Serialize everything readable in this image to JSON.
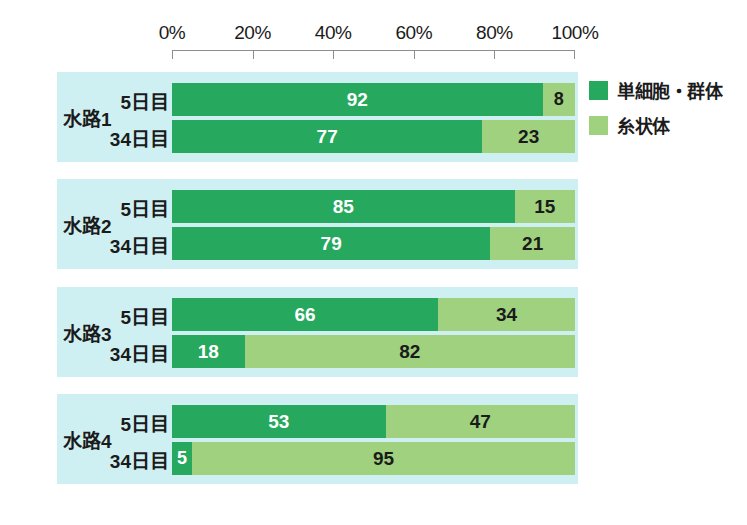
{
  "chart_data": {
    "type": "bar",
    "orientation": "horizontal",
    "stacked": true,
    "normalized": true,
    "title": "",
    "subtitle": "",
    "xlabel": "",
    "ylabel": "",
    "xlim": [
      0,
      100
    ],
    "grid": false,
    "legend_position": "right",
    "axis_ticks": [
      "0%",
      "20%",
      "40%",
      "60%",
      "80%",
      "100%"
    ],
    "axis_tick_values": [
      0,
      20,
      40,
      60,
      80,
      100
    ],
    "legend": [
      {
        "name": "単細胞・群体",
        "color": "#26a95e"
      },
      {
        "name": "糸状体",
        "color": "#9fd17e"
      }
    ],
    "series": [
      {
        "name": "単細胞・群体",
        "color": "#26a95e",
        "values": [
          92,
          77,
          85,
          79,
          66,
          18,
          53,
          5
        ]
      },
      {
        "name": "糸状体",
        "color": "#9fd17e",
        "values": [
          8,
          23,
          15,
          21,
          34,
          82,
          47,
          95
        ]
      }
    ],
    "categories": [
      "水路1 5日目",
      "水路1 34日目",
      "水路2 5日目",
      "水路2 34日目",
      "水路3 5日目",
      "水路3 34日目",
      "水路4 5日目",
      "水路4 34日目"
    ],
    "groups": [
      {
        "label": "水路1",
        "rows": [
          {
            "label": "5日目",
            "segments": [
              {
                "series": "単細胞・群体",
                "value": 92
              },
              {
                "series": "糸状体",
                "value": 8
              }
            ]
          },
          {
            "label": "34日目",
            "segments": [
              {
                "series": "単細胞・群体",
                "value": 77
              },
              {
                "series": "糸状体",
                "value": 23
              }
            ]
          }
        ]
      },
      {
        "label": "水路2",
        "rows": [
          {
            "label": "5日目",
            "segments": [
              {
                "series": "単細胞・群体",
                "value": 85
              },
              {
                "series": "糸状体",
                "value": 15
              }
            ]
          },
          {
            "label": "34日目",
            "segments": [
              {
                "series": "単細胞・群体",
                "value": 79
              },
              {
                "series": "糸状体",
                "value": 21
              }
            ]
          }
        ]
      },
      {
        "label": "水路3",
        "rows": [
          {
            "label": "5日目",
            "segments": [
              {
                "series": "単細胞・群体",
                "value": 66
              },
              {
                "series": "糸状体",
                "value": 34
              }
            ]
          },
          {
            "label": "34日目",
            "segments": [
              {
                "series": "単細胞・群体",
                "value": 18
              },
              {
                "series": "糸状体",
                "value": 82
              }
            ]
          }
        ]
      },
      {
        "label": "水路4",
        "rows": [
          {
            "label": "5日目",
            "segments": [
              {
                "series": "単細胞・群体",
                "value": 53
              },
              {
                "series": "糸状体",
                "value": 47
              }
            ]
          },
          {
            "label": "34日目",
            "segments": [
              {
                "series": "単細胞・群体",
                "value": 5
              },
              {
                "series": "糸状体",
                "value": 95
              }
            ]
          }
        ]
      }
    ]
  },
  "colors": {
    "series_a": "#26a95e",
    "series_b": "#9fd17e",
    "panel_background": "#cff0f2",
    "axis_line": "#8d8d8d",
    "page_background": "#ffffff",
    "label_text": "#1b1b1b",
    "value_text_on_dark": "#ffffff"
  },
  "bottom_caption": ""
}
